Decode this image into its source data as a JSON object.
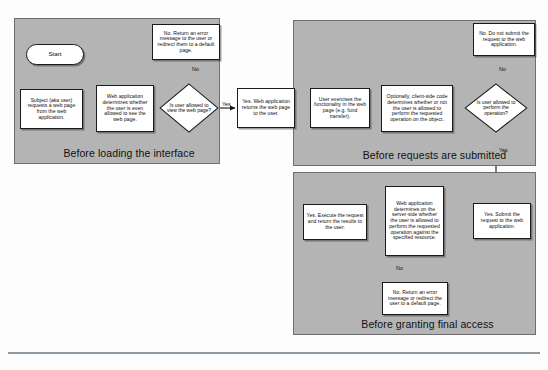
{
  "diagram": {
    "colors": {
      "panel_fill": "#b4b4b4",
      "panel_border": "#6e6e6e",
      "node_fill": "#ffffff",
      "node_border": "#1a1a1a",
      "text": "#0d0d0d",
      "rule": "#8d9aa3"
    },
    "panels": [
      {
        "id": "panel-load",
        "title": "Before loading the interface"
      },
      {
        "id": "panel-submit",
        "title": "Before requests are submitted"
      },
      {
        "id": "panel-final",
        "title": "Before granting final access"
      }
    ],
    "nodes": {
      "start": "Start",
      "subject_requests": "Subject (aka user) requests a web page from the web application.",
      "webapp_determines": "Web application determines whether the user is even allowed to see the web page.",
      "decision_view": "Is user allowed to view the web page?",
      "no_error_page": "No. Return an error message to the user or redirect them to a default page.",
      "yes_return_page": "Yes. Web application returns the web page to the user.",
      "user_exercises": "User exercises the functionality in the web page (e.g. fund transfer).",
      "client_side_check": "Optionally, client-side code determines whether or not the user is allowed to perform the requested operation on the object.",
      "decision_perform": "Is user allowed to perform the operation?",
      "no_do_not_submit": "No. Do not submit the request to the web application.",
      "yes_submit": "Yes. Submit the request to the web application.",
      "server_side_check": "Web application determines on the server-side whether the user is allowed to perform the requested operation against the specified resource.",
      "yes_execute": "Yes. Execute the request and return the results to the user.",
      "no_error_default": "No. Return an error message or redirect the user to a default page."
    },
    "edge_labels": {
      "no_view": "No",
      "yes_view": "Yes",
      "no_perform": "No",
      "yes_perform": "Yes",
      "no_server": "No"
    }
  }
}
